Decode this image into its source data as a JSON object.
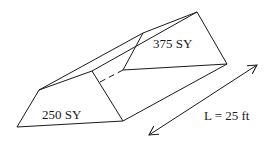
{
  "diagram": {
    "type": "prismoid",
    "end_areas": [
      {
        "id": "front",
        "label": "250 SY",
        "value": 250,
        "unit": "SY"
      },
      {
        "id": "back",
        "label": "375 SY",
        "value": 375,
        "unit": "SY"
      }
    ],
    "length": {
      "label": "L = 25 ft",
      "value": 25,
      "unit": "ft"
    },
    "colors": {
      "line": "#1a1a1a",
      "background": "#ffffff"
    }
  }
}
